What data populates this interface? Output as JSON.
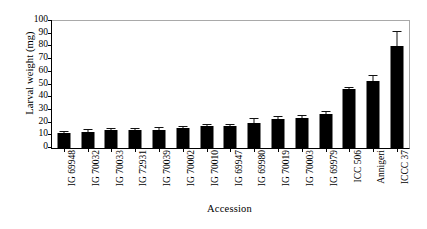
{
  "chart_data": {
    "type": "bar",
    "title": "",
    "xlabel": "Accession",
    "ylabel": "Larval weight (mg)",
    "ylim": [
      0,
      100
    ],
    "ytick_step": 10,
    "yticks": [
      0,
      10,
      20,
      30,
      40,
      50,
      60,
      70,
      80,
      90,
      100
    ],
    "grid": false,
    "legend": "none",
    "bar_color": "#000000",
    "error_bar_color": "#111111",
    "categories": [
      "IG 69948",
      "IG 70032",
      "IG 70033",
      "IG 72931",
      "IG 70039",
      "IG 70002",
      "IG 70010",
      "IG 69947",
      "IG 69980",
      "IG 70019",
      "IG 70003",
      "IG 69979",
      "ICC 506",
      "Annigeri",
      "ICCC 37"
    ],
    "values": [
      12,
      13,
      14,
      14,
      14.5,
      16,
      17,
      17,
      20,
      22.5,
      23.5,
      26.5,
      46.5,
      53,
      80
    ],
    "errors": [
      1,
      1.5,
      1,
      1,
      1,
      0.8,
      0.8,
      1.5,
      2.5,
      2,
      2,
      2,
      1,
      3.5,
      11
    ],
    "ylabel_unit": "mg"
  }
}
